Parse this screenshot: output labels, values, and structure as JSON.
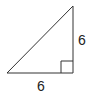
{
  "diagram": {
    "type": "right-triangle",
    "vertices": {
      "top": [
        73,
        6
      ],
      "bottom_left": [
        7,
        73
      ],
      "bottom_right": [
        73,
        73
      ]
    },
    "right_angle_marker": {
      "x": 61,
      "y": 61,
      "size": 12
    },
    "labels": {
      "vertical_leg": "6",
      "horizontal_leg": "6"
    },
    "colors": {
      "stroke": "#333333",
      "background": "#ffffff",
      "text": "#222222"
    }
  }
}
